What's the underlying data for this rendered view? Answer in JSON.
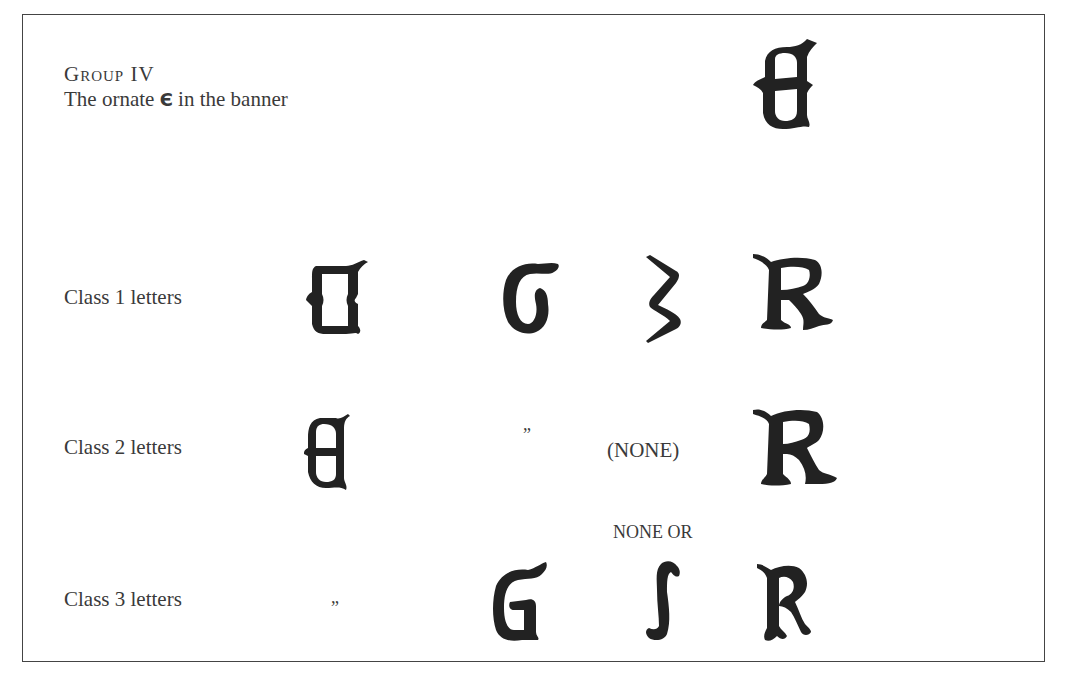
{
  "heading": {
    "group_title": "Group IV",
    "subtitle_before": "The ornate ",
    "subtitle_glyph": "Є",
    "subtitle_after": " in the banner"
  },
  "banner_glyph": "ornate-E",
  "rows": [
    {
      "label": "Class 1  letters",
      "cells": [
        "ornate-E",
        "ornate-G",
        "ornate-S",
        "ornate-R"
      ]
    },
    {
      "label": "Class 2  letters",
      "cells": [
        "ornate-E",
        "”",
        "(NONE)",
        "ornate-R"
      ]
    },
    {
      "label": "Class 3  letters",
      "cells": [
        "”",
        "ornate-G",
        "ornate-S",
        "ornate-R"
      ],
      "note": "NONE OR"
    }
  ]
}
